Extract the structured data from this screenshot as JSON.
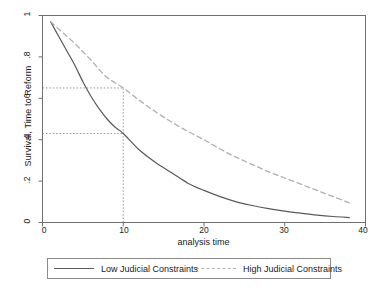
{
  "figure": {
    "width": 387,
    "height": 292,
    "background": "#ffffff"
  },
  "chart_data": {
    "type": "line",
    "title": "",
    "xlabel": "analysis time",
    "ylabel": "Survival, Time to Reform",
    "xlim": [
      0,
      40
    ],
    "ylim": [
      0,
      1
    ],
    "xticks": [
      0,
      10,
      20,
      30,
      40
    ],
    "xticklabels": [
      "0",
      "10",
      "20",
      "30",
      "40"
    ],
    "yticks": [
      0,
      0.2,
      0.4,
      0.6,
      0.8,
      1
    ],
    "yticklabels": [
      "0",
      ".2",
      ".4",
      ".6",
      ".8",
      "1"
    ],
    "grid": false,
    "legend_position": "bottom",
    "series": [
      {
        "name": "Low Judicial Constraints",
        "style": "solid",
        "color": "#5a5a5a",
        "x": [
          1,
          2,
          3,
          4,
          5,
          6,
          7,
          8,
          9,
          10,
          12,
          14,
          16,
          18,
          20,
          22,
          24,
          26,
          28,
          30,
          32,
          34,
          36,
          38
        ],
        "y": [
          0.97,
          0.9,
          0.83,
          0.76,
          0.68,
          0.61,
          0.55,
          0.5,
          0.46,
          0.43,
          0.35,
          0.29,
          0.24,
          0.19,
          0.155,
          0.125,
          0.1,
          0.082,
          0.067,
          0.055,
          0.045,
          0.036,
          0.029,
          0.024
        ]
      },
      {
        "name": "High Judicial Constraints",
        "style": "dashed",
        "color": "#b0b0b0",
        "x": [
          1,
          2,
          3,
          4,
          5,
          6,
          7,
          8,
          9,
          10,
          12,
          14,
          16,
          18,
          20,
          22,
          24,
          26,
          28,
          30,
          32,
          34,
          36,
          38
        ],
        "y": [
          0.97,
          0.935,
          0.9,
          0.865,
          0.825,
          0.785,
          0.74,
          0.7,
          0.675,
          0.65,
          0.59,
          0.535,
          0.485,
          0.44,
          0.4,
          0.355,
          0.315,
          0.28,
          0.245,
          0.215,
          0.185,
          0.155,
          0.125,
          0.095
        ]
      }
    ],
    "reference_lines": [
      {
        "name": "vertical-at-10",
        "orientation": "vertical",
        "value": 10,
        "style": "dotted",
        "color": "#9a9a9a"
      },
      {
        "name": "horizontal-high",
        "orientation": "horizontal",
        "value": 0.65,
        "style": "dotted",
        "color": "#9a9a9a"
      },
      {
        "name": "horizontal-low",
        "orientation": "horizontal",
        "value": 0.43,
        "style": "dotted",
        "color": "#9a9a9a"
      }
    ],
    "annotations": []
  },
  "legend": {
    "entries": [
      {
        "label": "Low Judicial Constraints",
        "style": "solid"
      },
      {
        "label": "High Judicial Constraints",
        "style": "dashed"
      }
    ]
  }
}
